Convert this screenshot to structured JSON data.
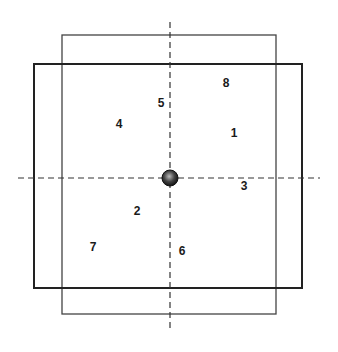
{
  "diagram": {
    "colors": {
      "line": "#2a2a2a",
      "background": "#ffffff"
    },
    "center": {
      "x": 170,
      "y": 178,
      "r": 8
    },
    "outer_rect": {
      "x": 34,
      "y": 64,
      "w": 268,
      "h": 224
    },
    "inner_rect": {
      "x": 62,
      "y": 35,
      "w": 214,
      "h": 279
    },
    "vertical_axis": {
      "x": 170,
      "y1": 22,
      "y2": 328
    },
    "horizontal_axis": {
      "y": 178,
      "x1": 18,
      "x2": 320
    },
    "labels": [
      {
        "text": "8",
        "x": 226,
        "y": 87
      },
      {
        "text": "5",
        "x": 161,
        "y": 107
      },
      {
        "text": "4",
        "x": 119,
        "y": 128
      },
      {
        "text": "1",
        "x": 234,
        "y": 137
      },
      {
        "text": "3",
        "x": 244,
        "y": 190
      },
      {
        "text": "2",
        "x": 137,
        "y": 215
      },
      {
        "text": "7",
        "x": 93,
        "y": 251
      },
      {
        "text": "6",
        "x": 182,
        "y": 255
      }
    ]
  }
}
